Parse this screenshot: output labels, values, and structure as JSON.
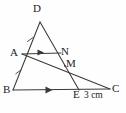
{
  "figure": {
    "background_color": "#fefefe",
    "stroke_color": "#3a3a3a",
    "label_color": "#232323",
    "width": 126,
    "height": 113,
    "points": [
      {
        "id": "D",
        "label": "D",
        "x": 40,
        "y": 22
      },
      {
        "id": "A",
        "label": "A",
        "x": 22,
        "y": 54
      },
      {
        "id": "N",
        "label": "N",
        "x": 60,
        "y": 54
      },
      {
        "id": "M",
        "label": "M",
        "x": 65,
        "y": 66
      },
      {
        "id": "B",
        "label": "B",
        "x": 13,
        "y": 90
      },
      {
        "id": "E",
        "label": "E",
        "x": 79,
        "y": 90
      },
      {
        "id": "C",
        "label": "C",
        "x": 110,
        "y": 89
      }
    ],
    "segments": [
      {
        "id": "DB",
        "from": "D",
        "to": "B",
        "note": "left side of triangle, passes through A"
      },
      {
        "id": "DE",
        "from": "D",
        "to": "E",
        "note": "right side of triangle, passes through N and M"
      },
      {
        "id": "BC",
        "from": "B",
        "to": "C",
        "note": "base line, passes through E"
      },
      {
        "id": "AN",
        "from": "A",
        "to": "N",
        "note": "horizontal segment parallel to BC"
      },
      {
        "id": "AC",
        "from": "A",
        "to": "C",
        "note": "passes through M"
      }
    ],
    "parallel_arrows": [
      {
        "id": "arrow-BE",
        "on_segment": "BC",
        "x": 50,
        "y": 90,
        "note": "single arrow mark indicating parallel"
      },
      {
        "id": "arrow-AN",
        "on_segment": "AN",
        "x": 41,
        "y": 52,
        "note": "single arrow mark indicating parallel"
      }
    ],
    "tick_marks": [
      {
        "id": "tick-DA",
        "on_segment": "DB",
        "x": 30,
        "y": 39,
        "note": "congruence tick on DA"
      },
      {
        "id": "tick-AB",
        "on_segment": "DB",
        "x": 18,
        "y": 72,
        "note": "congruence tick on AB"
      }
    ],
    "measurements": [
      {
        "id": "EC-length",
        "text": "3 cm",
        "between": "E-C"
      }
    ]
  }
}
